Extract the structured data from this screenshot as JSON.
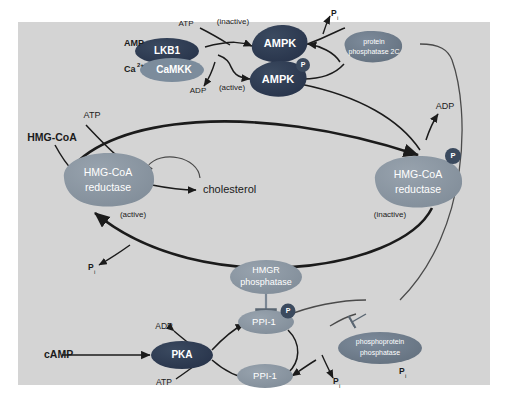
{
  "figure": {
    "background_color": "#d4d4d4",
    "page_color": "#ffffff"
  },
  "colors": {
    "dark_protein": "#2d3a4f",
    "mid_protein": "#6d7b8d",
    "light_protein": "#8fa0ad",
    "gray_protein": "#9aa5ad",
    "phosphate_circle": "#3b4a5e",
    "arrow": "#1b1b1b",
    "thin_arrow": "#4a4a4a",
    "text": "#1b1b1b",
    "node_text": "#ffffff"
  },
  "nodes": {
    "lkb1": {
      "label": "LKB1",
      "color": "#2d3a4f"
    },
    "camkk": {
      "label": "CaMKK",
      "color": "#7c8c9c"
    },
    "ampk_inactive": {
      "label": "AMPK",
      "state": "(inactive)",
      "color": "#2d3a4f"
    },
    "ampk_active": {
      "label": "AMPK",
      "state": "(active)",
      "color": "#2d3a4f",
      "phosphate": "P"
    },
    "protein_phosphatase_2c": {
      "label_line1": "protein",
      "label_line2": "phosphatase 2C",
      "color": "#6d7b8d"
    },
    "hmgcoa_reductase_active": {
      "label_line1": "HMG-CoA",
      "label_line2": "reductase",
      "state": "(active)",
      "color": "#8a96a2"
    },
    "hmgcoa_reductase_inactive": {
      "label_line1": "HMG-CoA",
      "label_line2": "reductase",
      "state": "(inactive)",
      "color": "#8a96a2",
      "phosphate": "P"
    },
    "hmgr_phosphatase": {
      "label_line1": "HMGR",
      "label_line2": "phosphatase",
      "color": "#8a96a2"
    },
    "ppi1_phospho": {
      "label": "PPI-1",
      "color": "#8a96a2",
      "phosphate": "P"
    },
    "ppi1_dephospho": {
      "label": "PPI-1",
      "color": "#8a96a2"
    },
    "pka": {
      "label": "PKA",
      "color": "#2d3a4f"
    },
    "phosphoprotein_phosphatase": {
      "label_line1": "phosphoprotein",
      "label_line2": "phosphatase",
      "color": "#6d7b8d"
    }
  },
  "metabolites": {
    "amp": "AMP",
    "ca": "Ca",
    "ca_charge": "2+",
    "atp_top": "ATP",
    "adp_top": "ADP",
    "pi_top": "P",
    "pi_sub": "i",
    "atp_left": "ATP",
    "hmg_coa": "HMG-CoA",
    "cholesterol": "cholesterol",
    "adp_right": "ADP",
    "pi_left_mid": "P",
    "adp_bottom": "ADP",
    "atp_bottom": "ATP",
    "camp": "cAMP",
    "pi_bottom_right": "P",
    "pi_bottom_far": "P"
  },
  "states": {
    "inactive": "(inactive)",
    "active": "(active)"
  }
}
